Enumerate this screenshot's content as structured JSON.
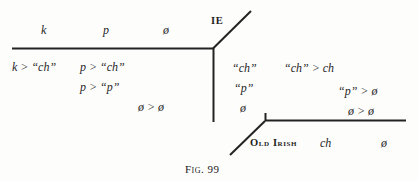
{
  "figure": {
    "caption": "Fig. 99",
    "nodes": {
      "ie_label": "IE",
      "old_irish_label": "Old Irish"
    },
    "top_axis_labels": [
      {
        "text": "k"
      },
      {
        "text": "p"
      },
      {
        "text": "ø"
      }
    ],
    "top_rules": [
      {
        "text": "k > “ch”"
      },
      {
        "text": "p > “ch”"
      },
      {
        "text": "p > “p”"
      },
      {
        "text": "ø > ø"
      }
    ],
    "middle_column_labels": [
      {
        "text": "“ch”"
      },
      {
        "text": "“p”"
      },
      {
        "text": "ø"
      }
    ],
    "right_rules": [
      {
        "text": "“ch” > ch"
      },
      {
        "text": "“p” > ø"
      },
      {
        "text": "ø > ø"
      }
    ],
    "bottom_axis_labels": [
      {
        "text": "ch"
      },
      {
        "text": "ø"
      }
    ],
    "colors": {
      "ink": "#1f1f1f",
      "line": "#232323",
      "page": "#fdfdfc"
    }
  }
}
